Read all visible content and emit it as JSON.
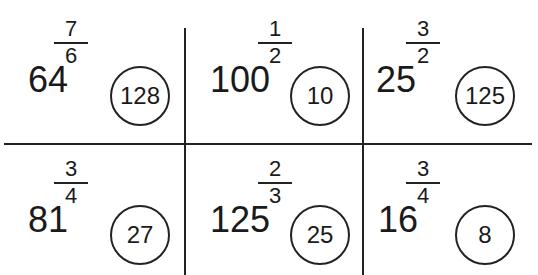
{
  "puzzle": {
    "cells": [
      {
        "base": "64",
        "numerator": "7",
        "denominator": "6",
        "answer": "128"
      },
      {
        "base": "100",
        "numerator": "1",
        "denominator": "2",
        "answer": "10"
      },
      {
        "base": "25",
        "numerator": "3",
        "denominator": "2",
        "answer": "125"
      },
      {
        "base": "81",
        "numerator": "3",
        "denominator": "4",
        "answer": "27"
      },
      {
        "base": "125",
        "numerator": "2",
        "denominator": "3",
        "answer": "25"
      },
      {
        "base": "16",
        "numerator": "3",
        "denominator": "4",
        "answer": "8"
      }
    ]
  },
  "colors": {
    "ink": "#222222",
    "background": "#ffffff"
  }
}
